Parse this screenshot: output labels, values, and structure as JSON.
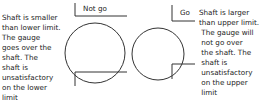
{
  "left_panel": {
    "label": "Not go",
    "description": [
      "Shaft is smaller",
      "than lower limit.",
      "The gauge",
      "goes over the",
      "shaft. The",
      "shaft is",
      "unsatisfactory",
      "on the lower",
      "limit"
    ]
  },
  "right_panel": {
    "label": "Go",
    "description": [
      "Shaft is larger",
      "than upper limit.",
      " The gauge will",
      " not go over",
      " the shaft. The",
      " shaft is",
      " unsatisfactory",
      " on the upper",
      " limit"
    ]
  },
  "colors": {
    "stroke": "#333333",
    "text": "#222222"
  }
}
